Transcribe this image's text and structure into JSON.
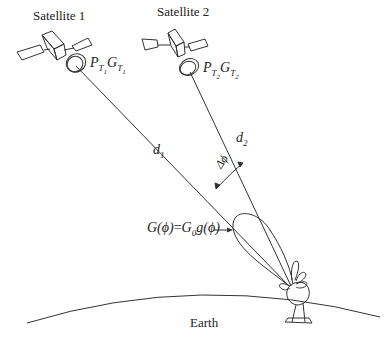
{
  "diagram": {
    "satellites": [
      {
        "name": "Satellite 1",
        "power_gain": {
          "P": "P",
          "P_sub": "T",
          "P_subsub": "1",
          "G": "G",
          "G_sub": "T",
          "G_subsub": "1"
        },
        "distance_label": {
          "main": "d",
          "sub": "1"
        }
      },
      {
        "name": "Satellite 2",
        "power_gain": {
          "P": "P",
          "P_sub": "T",
          "P_subsub": "2",
          "G": "G",
          "G_sub": "T",
          "G_subsub": "2"
        },
        "distance_label": {
          "main": "d",
          "sub": "2"
        }
      }
    ],
    "angle_label": "Δϕ",
    "antenna_gain_label": {
      "lhs": "G(ϕ)",
      "eq": "=",
      "rhs_G": "G",
      "rhs_sub": "0",
      "rhs_rest": "g(ϕ)"
    },
    "earth_label": "Earth",
    "colors": {
      "line": "#333333",
      "background": "#ffffff"
    }
  }
}
